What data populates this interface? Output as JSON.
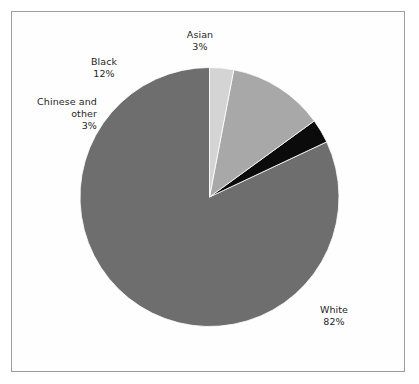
{
  "figure": {
    "background_color": "#ffffff",
    "frame_color": "#9c9c9c"
  },
  "chart_data": {
    "type": "pie",
    "title": "",
    "subtitle": "",
    "xlabel": "",
    "ylabel": "",
    "grid": false,
    "legend_position": "none",
    "label_format": "name above percentage",
    "start_angle_deg": 0,
    "direction": "counterclockwise",
    "categories": [
      "White",
      "Asian",
      "Black",
      "Chinese and other"
    ],
    "values": [
      82,
      3,
      12,
      3
    ],
    "value_labels": [
      "82%",
      "3%",
      "12%",
      "3%"
    ],
    "colors": [
      "#6e6e6e",
      "#0b0b0b",
      "#a8a8a8",
      "#d4d4d4"
    ],
    "slices": [
      {
        "name": "White",
        "name_label": "White",
        "value": 82,
        "value_label": "82%",
        "color": "#6e6e6e"
      },
      {
        "name": "Asian",
        "name_label": "Asian",
        "value": 3,
        "value_label": "3%",
        "color": "#0b0b0b"
      },
      {
        "name": "Black",
        "name_label": "Black",
        "value": 12,
        "value_label": "12%",
        "color": "#a8a8a8"
      },
      {
        "name": "Chinese and other",
        "name_label": "Chinese and other",
        "value": 3,
        "value_label": "3%",
        "color": "#d4d4d4"
      }
    ]
  }
}
